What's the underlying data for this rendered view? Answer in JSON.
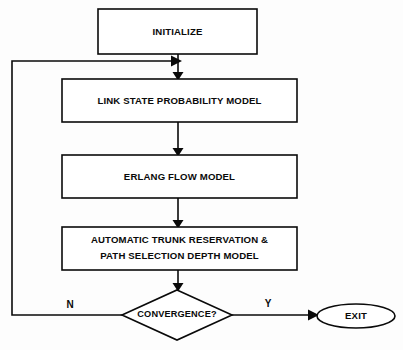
{
  "diagram": {
    "type": "flowchart",
    "orientation": "top-to-bottom",
    "background_color": "#fdfdfd",
    "line_color": "#0a0a0a",
    "fill_color": "#ffffff",
    "nodes": [
      {
        "id": "initialize",
        "shape": "rectangle",
        "label": "INITIALIZE",
        "lines": [
          "INITIALIZE"
        ]
      },
      {
        "id": "link_state",
        "shape": "rectangle",
        "label": "LINK STATE PROBABILITY MODEL",
        "lines": [
          "LINK STATE PROBABILITY MODEL"
        ]
      },
      {
        "id": "erlang_flow",
        "shape": "rectangle",
        "label": "ERLANG FLOW MODEL",
        "lines": [
          "ERLANG FLOW MODEL"
        ]
      },
      {
        "id": "trunk_reservation",
        "shape": "rectangle",
        "label": "AUTOMATIC TRUNK RESERVATION & PATH SELECTION DEPTH MODEL",
        "lines": [
          "AUTOMATIC TRUNK RESERVATION &",
          "PATH SELECTION DEPTH MODEL"
        ]
      },
      {
        "id": "convergence",
        "shape": "diamond",
        "label": "CONVERGENCE?",
        "lines": [
          "CONVERGENCE?"
        ]
      },
      {
        "id": "exit",
        "shape": "ellipse",
        "label": "EXIT",
        "lines": [
          "EXIT"
        ]
      }
    ],
    "edge_labels": {
      "no_branch": "N",
      "yes_branch": "Y"
    },
    "edges": [
      {
        "from": "initialize",
        "to": "link_state",
        "label": ""
      },
      {
        "from": "link_state",
        "to": "erlang_flow",
        "label": ""
      },
      {
        "from": "erlang_flow",
        "to": "trunk_reservation",
        "label": ""
      },
      {
        "from": "trunk_reservation",
        "to": "convergence",
        "label": ""
      },
      {
        "from": "convergence",
        "to": "exit",
        "label": "Y"
      },
      {
        "from": "convergence",
        "to": "link_state",
        "label": "N"
      }
    ]
  }
}
